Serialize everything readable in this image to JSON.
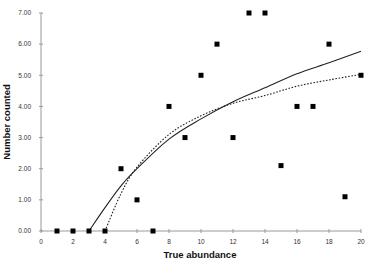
{
  "chart_data": {
    "type": "scatter",
    "title": "",
    "xlabel": "True abundance",
    "ylabel": "Number counted",
    "xlim": [
      0,
      20
    ],
    "ylim": [
      0,
      7
    ],
    "grid": false,
    "legend": null,
    "x_ticks": [
      0,
      2,
      4,
      6,
      8,
      10,
      12,
      14,
      16,
      18,
      20
    ],
    "x_tick_labels": [
      "0",
      "2",
      "4",
      "6",
      "8",
      "10",
      "12",
      "14",
      "16",
      "18",
      "20"
    ],
    "y_ticks": [
      0,
      1,
      2,
      3,
      4,
      5,
      6,
      7
    ],
    "y_tick_labels": [
      "0.00",
      "1.00",
      "2.00",
      "3.00",
      "4.00",
      "5.00",
      "6.00",
      "7.00"
    ],
    "series": [
      {
        "name": "Observed counts",
        "kind": "scatter",
        "marker": "square",
        "color": "#000000",
        "x": [
          1,
          2,
          3,
          4,
          5,
          6,
          7,
          8,
          9,
          10,
          11,
          12,
          13,
          14,
          15,
          16,
          17,
          18,
          19,
          20
        ],
        "y": [
          0,
          0,
          0,
          0,
          2.0,
          1.0,
          0,
          4.0,
          3.0,
          5.0,
          6.0,
          3.0,
          7.0,
          7.0,
          2.1,
          4.0,
          4.0,
          6.0,
          1.1,
          5.0
        ]
      },
      {
        "name": "Fit (solid)",
        "kind": "line",
        "style": "solid",
        "color": "#222222",
        "x": [
          3,
          4,
          5,
          6,
          8,
          10,
          12,
          14,
          16,
          18,
          20
        ],
        "y": [
          0,
          0.75,
          1.45,
          2.0,
          2.95,
          3.6,
          4.15,
          4.6,
          5.05,
          5.4,
          5.77
        ]
      },
      {
        "name": "Fit (dotted)",
        "kind": "line",
        "style": "dotted",
        "color": "#222222",
        "x": [
          4,
          5,
          6,
          8,
          10,
          12,
          14,
          16,
          18,
          20
        ],
        "y": [
          0,
          1.2,
          2.05,
          3.1,
          3.7,
          4.1,
          4.35,
          4.65,
          4.85,
          5.03
        ]
      }
    ]
  }
}
